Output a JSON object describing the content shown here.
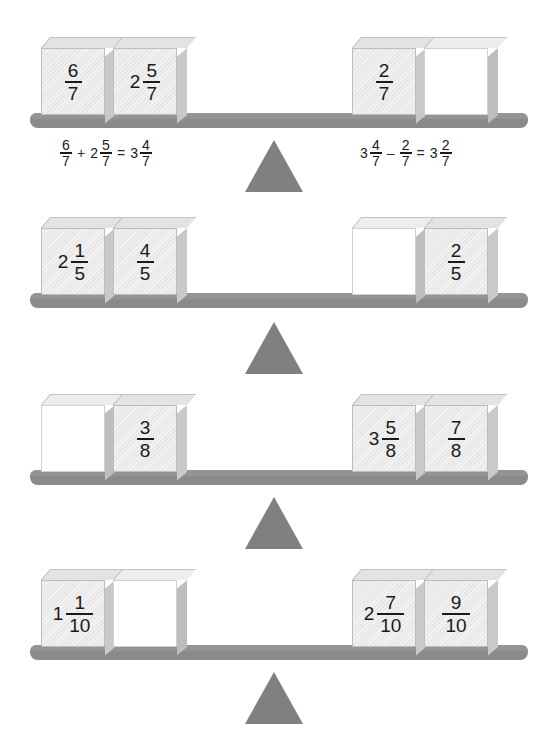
{
  "page": {
    "background_color": "#ffffff",
    "beam_color": "#8a8a8a",
    "fulcrum_color": "#808080",
    "block_face_color": "#e8e8e8",
    "empty_block_color": "#ffffff",
    "text_color": "#1a1a1a"
  },
  "rows": [
    {
      "id": "row-1",
      "left_blocks": [
        {
          "whole": "",
          "num": "6",
          "den": "7",
          "empty": false
        },
        {
          "whole": "2",
          "num": "5",
          "den": "7",
          "empty": false
        }
      ],
      "right_blocks": [
        {
          "whole": "",
          "num": "2",
          "den": "7",
          "empty": false
        },
        {
          "whole": "",
          "num": "",
          "den": "",
          "empty": true
        }
      ],
      "left_equation": {
        "terms": [
          {
            "whole": "",
            "num": "6",
            "den": "7"
          },
          {
            "op": "+"
          },
          {
            "whole": "2",
            "num": "5",
            "den": "7"
          },
          {
            "op": "="
          },
          {
            "whole": "3",
            "num": "4",
            "den": "7"
          }
        ]
      },
      "right_equation": {
        "terms": [
          {
            "whole": "3",
            "num": "4",
            "den": "7"
          },
          {
            "op": "–"
          },
          {
            "whole": "",
            "num": "2",
            "den": "7"
          },
          {
            "op": "="
          },
          {
            "whole": "3",
            "num": "2",
            "den": "7"
          }
        ]
      }
    },
    {
      "id": "row-2",
      "left_blocks": [
        {
          "whole": "2",
          "num": "1",
          "den": "5",
          "empty": false
        },
        {
          "whole": "",
          "num": "4",
          "den": "5",
          "empty": false
        }
      ],
      "right_blocks": [
        {
          "whole": "",
          "num": "",
          "den": "",
          "empty": true
        },
        {
          "whole": "",
          "num": "2",
          "den": "5",
          "empty": false
        }
      ],
      "left_equation": null,
      "right_equation": null
    },
    {
      "id": "row-3",
      "left_blocks": [
        {
          "whole": "",
          "num": "",
          "den": "",
          "empty": true
        },
        {
          "whole": "",
          "num": "3",
          "den": "8",
          "empty": false
        }
      ],
      "right_blocks": [
        {
          "whole": "3",
          "num": "5",
          "den": "8",
          "empty": false
        },
        {
          "whole": "",
          "num": "7",
          "den": "8",
          "empty": false
        }
      ],
      "left_equation": null,
      "right_equation": null
    },
    {
      "id": "row-4",
      "left_blocks": [
        {
          "whole": "1",
          "num": "1",
          "den": "10",
          "empty": false
        },
        {
          "whole": "",
          "num": "",
          "den": "",
          "empty": true
        }
      ],
      "right_blocks": [
        {
          "whole": "2",
          "num": "7",
          "den": "10",
          "empty": false
        },
        {
          "whole": "",
          "num": "9",
          "den": "10",
          "empty": false
        }
      ],
      "left_equation": null,
      "right_equation": null
    }
  ]
}
